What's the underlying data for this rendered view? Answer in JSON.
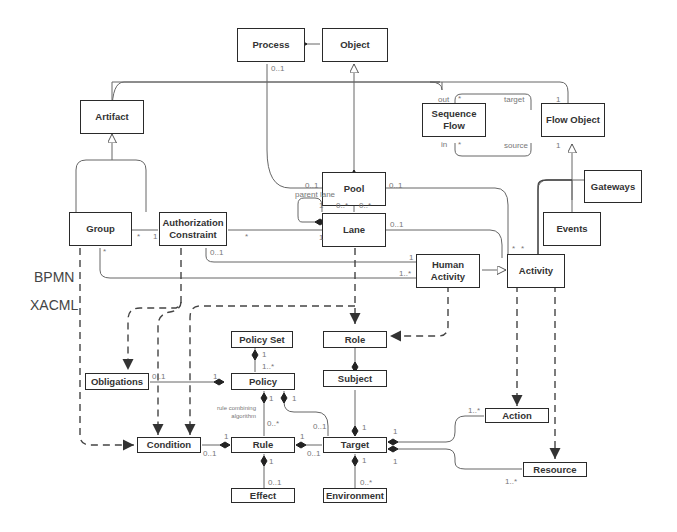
{
  "diagram": {
    "type": "UML class diagram",
    "sections": {
      "upper": "BPMN",
      "lower": "XACML"
    },
    "classes": {
      "process": "Process",
      "object": "Object",
      "artifact": "Artifact",
      "sequence_flow": "Sequence Flow",
      "flow_object": "Flow Object",
      "pool": "Pool",
      "gateways": "Gateways",
      "group": "Group",
      "authorization_constraint": "Authorization Constraint",
      "lane": "Lane",
      "events": "Events",
      "human_activity": "Human Activity",
      "activity": "Activity",
      "policy_set": "Policy Set",
      "role": "Role",
      "obligations": "Obligations",
      "policy": "Policy",
      "subject": "Subject",
      "action": "Action",
      "condition": "Condition",
      "rule": "Rule",
      "target": "Target",
      "resource": "Resource",
      "effect": "Effect",
      "environment": "Environment"
    },
    "labels": {
      "process_object_mult": "0..1",
      "seqflow_out": "out",
      "seqflow_out_mult": "*",
      "seqflow_in": "in",
      "seqflow_in_mult": "*",
      "flow_target": "target",
      "flow_target_mult": "1",
      "flow_source": "source",
      "flow_source_mult": "1",
      "pool_left_mult": "0..1",
      "pool_right_mult": "0..1",
      "parent_lane": "parent lane",
      "lane_self_1": "1",
      "lane_self_many": "0..*",
      "pool_lane_many": "0..*",
      "lane_left_1": "1",
      "lane_right_mult": "0..1",
      "group_ac_star": "*",
      "group_ac_1": "1",
      "ac_lane_star": "*",
      "group_bottom_star": "*",
      "ac_bottom_mult": "0..1",
      "ha_top_1": "1",
      "ha_left_many": "1..*",
      "activity_star_1": "*",
      "activity_star_2": "*",
      "policyset_policy_1": "1",
      "policyset_policy_many": "1..*",
      "obligations_mult": "0..1",
      "policy_obligations_1": "1",
      "policy_rule_1": "1",
      "policy_target_1": "1",
      "rule_comb_alg": "rule combining algorithm",
      "rule_many": "0..*",
      "target_policy_mult": "0..1",
      "subject_target_1": "1",
      "target_top_1": "1",
      "action_mult": "1..*",
      "target_action_1": "1",
      "condition_rule_1": "1",
      "condition_mult": "0..1",
      "rule_target_1": "1",
      "rule_target_mult": "0..1",
      "target_resource_1": "1",
      "target_env_1": "1",
      "resource_mult": "1..*",
      "rule_effect_1": "1",
      "effect_mult": "0..1",
      "env_mult": "0..*"
    },
    "colors": {
      "line": "#2a2a2a",
      "light_line": "#888888",
      "text": "#333333",
      "mult_text": "#777777"
    }
  }
}
